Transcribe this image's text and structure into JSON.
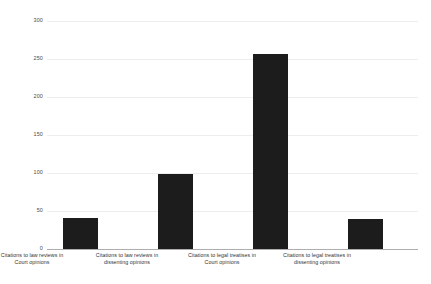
{
  "chart_data": {
    "type": "bar",
    "title": "",
    "subtitle": "",
    "xlabel": "",
    "ylabel": "",
    "grid": true,
    "legend": false,
    "ylim": [
      0,
      300
    ],
    "ytick_labels": [
      "300",
      "250",
      "200",
      "150",
      "100",
      "50",
      "0"
    ],
    "ytick_values": [
      300,
      250,
      200,
      150,
      100,
      50,
      0
    ],
    "categories": [
      "Citations to law reviews in Court opinions",
      "Citations to law reviews in dissenting opinions",
      "Citations to legal treatises in Court opinions",
      "Citations to legal treatises in dissenting opinions"
    ],
    "category_lines": [
      [
        "Citations to law reviews in",
        "Court opinions"
      ],
      [
        "Citations to law reviews in",
        "dissenting opinions"
      ],
      [
        "Citations to legal treatises in",
        "Court opinions"
      ],
      [
        "Citations to legal treatises in",
        "dissenting opinions"
      ]
    ],
    "values": [
      41,
      99,
      256,
      39
    ],
    "bar_color": "#1c1c1c",
    "grid_color": "#ededed",
    "axis_color": "#aeaeae",
    "background_color": "#ffffff"
  }
}
